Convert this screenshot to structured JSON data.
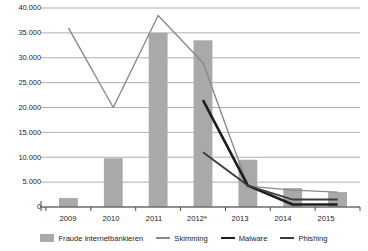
{
  "chart_data": {
    "type": "bar",
    "title": "",
    "subtitle": "",
    "xlabel": "",
    "ylabel": "",
    "categories": [
      "2009",
      "2010",
      "2011",
      "2012*",
      "2013",
      "2014",
      "2015"
    ],
    "ylim": [
      0,
      40000
    ],
    "yticks": [
      "0",
      "5.000",
      "10.000",
      "15.000",
      "20.000",
      "25.000",
      "30.000",
      "35.000",
      "40.000"
    ],
    "ytick_values": [
      0,
      5000,
      10000,
      15000,
      20000,
      25000,
      30000,
      35000,
      40000
    ],
    "grid": true,
    "legend_position": "bottom",
    "bar_series": {
      "name": "Fraude internetbankieren",
      "type": "bar",
      "color": "#a9a9a9",
      "values": [
        1800,
        9800,
        35000,
        33500,
        9500,
        3800,
        3000
      ]
    },
    "series": [
      {
        "name": "Skimming",
        "type": "line",
        "color": "#8a8a8a",
        "width": "thin",
        "x": [
          "2009",
          "2010",
          "2011",
          "2012*",
          "2013",
          "2014",
          "2015"
        ],
        "values": [
          36000,
          20000,
          38500,
          29000,
          4200,
          3400,
          3000
        ]
      },
      {
        "name": "Malware",
        "type": "line",
        "color": "#1c1c1c",
        "width": "thick",
        "x": [
          "2012*",
          "2013",
          "2014",
          "2015"
        ],
        "values": [
          21500,
          4300,
          500,
          500
        ]
      },
      {
        "name": "Phishing",
        "type": "line",
        "color": "#3d3d3d",
        "width": "med",
        "x": [
          "2012*",
          "2013",
          "2014",
          "2015"
        ],
        "values": [
          11000,
          4300,
          1500,
          1500
        ]
      }
    ]
  },
  "axis": {
    "y_labels": [
      "40.000",
      "35.000",
      "30.000",
      "25.000",
      "20.000",
      "15.000",
      "10.000",
      "5.000",
      "0"
    ],
    "x_labels": [
      "2009",
      "2010",
      "2011",
      "2012*",
      "2013",
      "2014",
      "2015"
    ]
  },
  "legend": {
    "items": [
      {
        "label": "Fraude internetbankieren",
        "marker": "bar-swatch",
        "color": "#a9a9a9"
      },
      {
        "label": "Skimming",
        "marker": "line-swatch-thin",
        "color": "#8a8a8a"
      },
      {
        "label": "Malware",
        "marker": "line-swatch-thick",
        "color": "#1c1c1c"
      },
      {
        "label": "Phishing",
        "marker": "line-swatch-med",
        "color": "#3d3d3d"
      }
    ]
  }
}
